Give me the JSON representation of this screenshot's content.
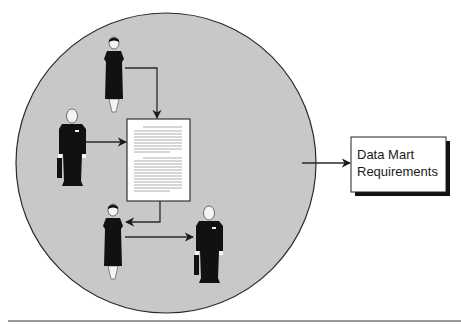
{
  "diagram": {
    "type": "process-diagram",
    "group": {
      "shape": "circle",
      "fill": "#c8c8c8",
      "stroke": "#2a2a2a",
      "members": [
        {
          "role": "person-woman",
          "position": "top"
        },
        {
          "role": "person-man",
          "position": "left"
        },
        {
          "role": "person-woman",
          "position": "bottom-left"
        },
        {
          "role": "person-man",
          "position": "bottom-right"
        }
      ],
      "document": {
        "role": "requirements-document"
      }
    },
    "output_box": {
      "line1": "Data Mart",
      "line2": "Requirements"
    },
    "flows": [
      {
        "from": "top-woman",
        "to": "document"
      },
      {
        "from": "left-man",
        "to": "document"
      },
      {
        "from": "document",
        "to": "bottom-woman"
      },
      {
        "from": "bottom-woman",
        "to": "bottom-man"
      },
      {
        "from": "group",
        "to": "output_box"
      }
    ],
    "colors": {
      "circle_fill": "#c8c8c8",
      "figure": "#111111",
      "line": "#2a2a2a",
      "paper": "#ffffff"
    }
  }
}
